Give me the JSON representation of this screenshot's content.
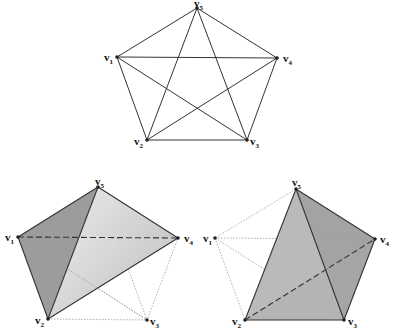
{
  "figures": [
    {
      "id": "complete-graph-k5",
      "vertices": [
        {
          "name": "v",
          "sub": "1",
          "x": 117,
          "y": 57,
          "lx": 104,
          "ly": 61
        },
        {
          "name": "v",
          "sub": "2",
          "x": 147,
          "y": 140,
          "lx": 134,
          "ly": 145
        },
        {
          "name": "v",
          "sub": "3",
          "x": 247,
          "y": 140,
          "lx": 250,
          "ly": 145
        },
        {
          "name": "v",
          "sub": "4",
          "x": 277,
          "y": 58,
          "lx": 283,
          "ly": 62
        },
        {
          "name": "v",
          "sub": "5",
          "x": 197,
          "y": 8,
          "lx": 194,
          "ly": 7
        }
      ],
      "edges": [
        [
          0,
          1
        ],
        [
          0,
          2
        ],
        [
          0,
          3
        ],
        [
          0,
          4
        ],
        [
          1,
          2
        ],
        [
          1,
          3
        ],
        [
          1,
          4
        ],
        [
          2,
          3
        ],
        [
          2,
          4
        ],
        [
          3,
          4
        ]
      ]
    },
    {
      "id": "tetrahedron-v1v2v4v5",
      "vertices": [
        {
          "name": "v",
          "sub": "1",
          "x": 18,
          "y": 237,
          "lx": 5,
          "ly": 241
        },
        {
          "name": "v",
          "sub": "2",
          "x": 48,
          "y": 319,
          "lx": 35,
          "ly": 324
        },
        {
          "name": "v",
          "sub": "3",
          "x": 147,
          "y": 320,
          "lx": 150,
          "ly": 325
        },
        {
          "name": "v",
          "sub": "4",
          "x": 178,
          "y": 238,
          "lx": 184,
          "ly": 242
        },
        {
          "name": "v",
          "sub": "5",
          "x": 98,
          "y": 187,
          "lx": 95,
          "ly": 185
        }
      ]
    },
    {
      "id": "tetrahedron-v2v3v4v5",
      "vertices": [
        {
          "name": "v",
          "sub": "1",
          "x": 215,
          "y": 238,
          "lx": 203,
          "ly": 242
        },
        {
          "name": "v",
          "sub": "2",
          "x": 245,
          "y": 320,
          "lx": 232,
          "ly": 325
        },
        {
          "name": "v",
          "sub": "3",
          "x": 344,
          "y": 320,
          "lx": 348,
          "ly": 325
        },
        {
          "name": "v",
          "sub": "4",
          "x": 375,
          "y": 239,
          "lx": 380,
          "ly": 243
        },
        {
          "name": "v",
          "sub": "5",
          "x": 296,
          "y": 189,
          "lx": 292,
          "ly": 186
        }
      ]
    }
  ],
  "colors": {
    "edge": "#333333",
    "dotted": "#9a9a9a",
    "face_dark": "#9c9c9c",
    "face_mid": "#b4b4b4",
    "face_light": "#e4e4e4"
  }
}
